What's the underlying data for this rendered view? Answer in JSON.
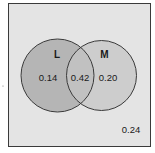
{
  "diagram": {
    "type": "venn",
    "colors": {
      "universe_fill": "#e4e4e4",
      "universe_stroke": "#3a3a3a",
      "set_L_fill": "#b7b7b7",
      "set_M_fill": "#cfcfcf",
      "overlap_fill": "#c2c2c2",
      "circle_stroke": "#3a3a3a"
    },
    "sets": [
      {
        "name": "L",
        "only_value": "0.14"
      },
      {
        "name": "M",
        "only_value": "0.20"
      }
    ],
    "intersection_value": "0.42",
    "outside_value": "0.24"
  }
}
